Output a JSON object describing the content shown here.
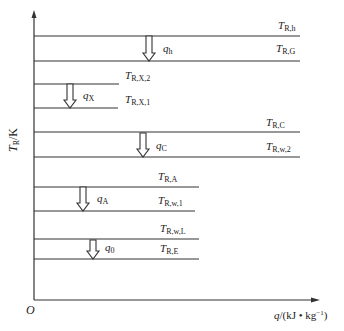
{
  "diagram": {
    "axes": {
      "y_label_main": "T",
      "y_label_sub": "R",
      "y_label_unit": "/K",
      "x_label_var": "q",
      "x_label_unit": "/(kJ • kg",
      "x_label_exp": "−1",
      "x_label_close": ")",
      "origin": "O"
    },
    "levels": [
      {
        "id": "R,h",
        "main": "T",
        "sub": "R,h"
      },
      {
        "id": "R,G",
        "main": "T",
        "sub": "R,G"
      },
      {
        "id": "R,X,2",
        "main": "T",
        "sub": "R,X,2"
      },
      {
        "id": "R,X,1",
        "main": "T",
        "sub": "R,X,1"
      },
      {
        "id": "R,C",
        "main": "T",
        "sub": "R,C"
      },
      {
        "id": "R,w,2",
        "main": "T",
        "sub": "R,w,2"
      },
      {
        "id": "R,A",
        "main": "T",
        "sub": "R,A"
      },
      {
        "id": "R,w,1",
        "main": "T",
        "sub": "R,w,1"
      },
      {
        "id": "R,w,L",
        "main": "T",
        "sub": "R,w,L"
      },
      {
        "id": "R,E",
        "main": "T",
        "sub": "R,E"
      }
    ],
    "heat_flows": [
      {
        "main": "q",
        "sub": "h"
      },
      {
        "main": "q",
        "sub": "X"
      },
      {
        "main": "q",
        "sub": "C"
      },
      {
        "main": "q",
        "sub": "A"
      },
      {
        "main": "q",
        "sub": "0"
      }
    ],
    "colors": {
      "line": "#333333",
      "background": "#ffffff"
    }
  }
}
